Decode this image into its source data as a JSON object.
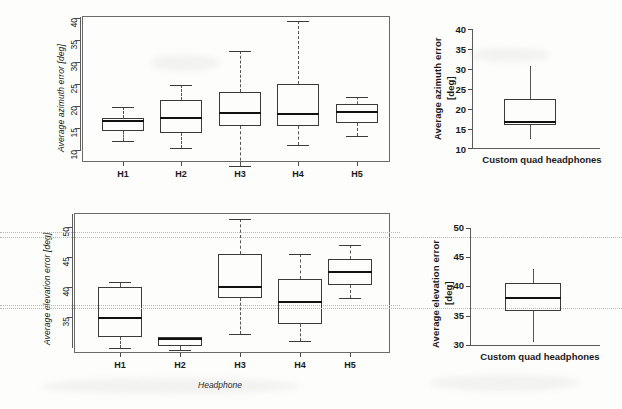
{
  "figure": {
    "panels": [
      "azimuth-by-headphone",
      "azimuth-custom",
      "elevation-by-headphone",
      "elevation-custom"
    ]
  },
  "chart_data": [
    {
      "id": "azimuth-by-headphone",
      "type": "box",
      "title": "",
      "xlabel": "",
      "ylabel": "Average azimuth error [deg]",
      "categories": [
        "H1",
        "H2",
        "H3",
        "H4",
        "H5"
      ],
      "ylim": [
        8.2,
        41.2
      ],
      "yticks": [
        10,
        15,
        20,
        25,
        30,
        35,
        40
      ],
      "grid": false,
      "legend": "none",
      "boxes": [
        {
          "category": "H1",
          "whisker_low": 12.9,
          "q1": 15.2,
          "median": 17.4,
          "q3": 18.1,
          "whisker_high": 20.7
        },
        {
          "category": "H2",
          "whisker_low": 11.3,
          "q1": 14.8,
          "median": 18.2,
          "q3": 22.2,
          "whisker_high": 25.7
        },
        {
          "category": "H3",
          "whisker_low": 7.3,
          "q1": 16.4,
          "median": 19.2,
          "q3": 24.1,
          "whisker_high": 33.4
        },
        {
          "category": "H4",
          "whisker_low": 12.1,
          "q1": 16.3,
          "median": 19.0,
          "q3": 25.9,
          "whisker_high": 40.0
        },
        {
          "category": "H5",
          "whisker_low": 14.1,
          "q1": 17.1,
          "median": 19.5,
          "q3": 21.2,
          "whisker_high": 22.9
        }
      ]
    },
    {
      "id": "azimuth-custom",
      "type": "box",
      "title": "",
      "xlabel": "",
      "ylabel": "Average azimuth error [deg]",
      "categories": [
        "Custom quad headphones"
      ],
      "ylim": [
        9.5,
        40.5
      ],
      "yticks": [
        10,
        15,
        20,
        25,
        30,
        35,
        40
      ],
      "grid": false,
      "legend": "none",
      "boxes": [
        {
          "category": "Custom quad headphones",
          "whisker_low": 12.0,
          "q1": 15.3,
          "median": 16.2,
          "q3": 22.0,
          "whisker_high": 30.5
        }
      ]
    },
    {
      "id": "elevation-by-headphone",
      "type": "box",
      "title": "",
      "xlabel": "Headphone",
      "ylabel": "Average elevation error [deg]",
      "categories": [
        "H1",
        "H2",
        "H3",
        "H4",
        "H5"
      ],
      "ylim": [
        31.6,
        52.3
      ],
      "yticks": [
        35,
        40,
        45,
        50
      ],
      "gridlines": [
        36.2,
        48.4
      ],
      "grid": true,
      "legend": "none",
      "boxes": [
        {
          "category": "H1",
          "whisker_low": 32.3,
          "q1": 34.0,
          "median": 36.8,
          "q3": 41.3,
          "whisker_high": 42.1
        },
        {
          "category": "H2",
          "whisker_low": 32.1,
          "q1": 32.7,
          "median": 33.7,
          "q3": 33.9,
          "whisker_high": 34.0
        },
        {
          "category": "H3",
          "whisker_low": 34.4,
          "q1": 39.7,
          "median": 41.3,
          "q3": 46.2,
          "whisker_high": 51.4
        },
        {
          "category": "H4",
          "whisker_low": 33.4,
          "q1": 35.9,
          "median": 39.2,
          "q3": 42.5,
          "whisker_high": 46.3
        },
        {
          "category": "H5",
          "whisker_low": 39.8,
          "q1": 41.7,
          "median": 43.6,
          "q3": 45.5,
          "whisker_high": 47.5
        }
      ]
    },
    {
      "id": "elevation-custom",
      "type": "box",
      "title": "",
      "xlabel": "",
      "ylabel": "Average elevation error [deg]",
      "categories": [
        "Custom quad headphones"
      ],
      "ylim": [
        29.5,
        50.5
      ],
      "yticks": [
        30,
        35,
        40,
        45,
        50
      ],
      "gridlines": [
        36.3,
        48.4
      ],
      "grid": true,
      "legend": "none",
      "boxes": [
        {
          "category": "Custom quad headphones",
          "whisker_low": 30.2,
          "q1": 35.5,
          "median": 37.8,
          "q3": 40.3,
          "whisker_high": 42.8
        }
      ]
    }
  ],
  "labels": {
    "azimuth_axis_title": "Average azimuth error [deg]",
    "azimuth_axis_title_line1": "Average azimuth error",
    "azimuth_axis_title_line2": "[deg]",
    "elevation_axis_title": "Average elevation error [deg]",
    "elevation_axis_title_line1": "Average elevation error",
    "elevation_axis_title_line2": "[deg]",
    "headphone_axis_title": "Headphone",
    "custom_category": "Custom quad headphones",
    "h1": "H1",
    "h2": "H2",
    "h3": "H3",
    "h4": "H4",
    "h5": "H5",
    "t10": "10",
    "t15": "15",
    "t20": "20",
    "t25": "25",
    "t30": "30",
    "t35": "35",
    "t40": "40",
    "t45": "45",
    "t50": "50"
  },
  "colors": {
    "background": "#fdfdfc",
    "line": "#3a3a3a",
    "median": "#111111",
    "grid": "#b8b8b8",
    "text": "#1a1a1a"
  }
}
